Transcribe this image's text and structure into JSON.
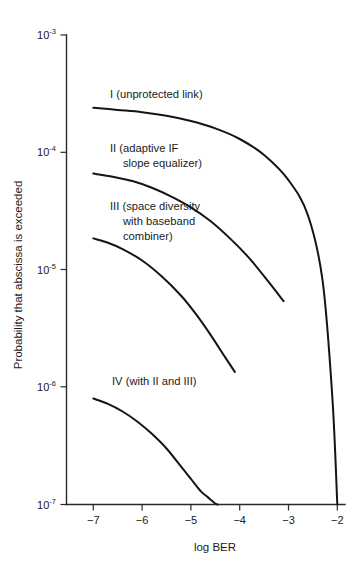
{
  "chart_data": {
    "type": "line",
    "title": "",
    "xlabel": "log BER",
    "ylabel": "Probability that abscissa is exceeded",
    "xlim": [
      -7.5,
      -1.8
    ],
    "ylim": [
      1e-07,
      0.001
    ],
    "yscale": "log",
    "xscale": "linear",
    "grid": false,
    "legend": "inline-annotations",
    "xticks": [
      -7,
      -6,
      -5,
      -4,
      -3,
      -2
    ],
    "xticklabels": [
      "−7",
      "−6",
      "−5",
      "−4",
      "−3",
      "−2"
    ],
    "yticks": [
      0.001,
      0.0001,
      1e-05,
      1e-06,
      1e-07
    ],
    "yticklabels": [
      "10−3",
      "10−4",
      "10−5",
      "10−6",
      "10−7"
    ],
    "ytick_mantissa": "10",
    "ytick_exponents": [
      "-3",
      "-4",
      "-5",
      "-6",
      "-7"
    ],
    "series": [
      {
        "name": "I (unprotected link)",
        "label_lines": [
          "I (unprotected link)"
        ],
        "x": [
          -7.0,
          -6.5,
          -6.0,
          -5.5,
          -5.0,
          -4.5,
          -4.0,
          -3.5,
          -3.0,
          -2.6,
          -2.3,
          -2.1,
          -2.0
        ],
        "y": [
          0.00024,
          0.00023,
          0.00022,
          0.000205,
          0.000185,
          0.00016,
          0.00013,
          9.5e-05,
          5.8e-05,
          2.9e-05,
          8e-06,
          8e-07,
          1e-07
        ]
      },
      {
        "name": "II (adaptive IF slope equalizer)",
        "label_lines": [
          "II (adaptive IF",
          "slope equalizer)"
        ],
        "x": [
          -7.0,
          -6.6,
          -6.2,
          -5.8,
          -5.4,
          -5.0,
          -4.6,
          -4.2,
          -3.8,
          -3.4,
          -3.1
        ],
        "y": [
          6.6e-05,
          6.2e-05,
          5.7e-05,
          5e-05,
          4.2e-05,
          3.4e-05,
          2.6e-05,
          1.85e-05,
          1.25e-05,
          7.8e-06,
          5.4e-06
        ]
      },
      {
        "name": "III (space diversity with baseband combiner)",
        "label_lines": [
          "III (space diversity",
          "with baseband",
          "combiner)"
        ],
        "x": [
          -7.0,
          -6.7,
          -6.4,
          -6.0,
          -5.6,
          -5.2,
          -4.9,
          -4.6,
          -4.3,
          -4.1
        ],
        "y": [
          1.85e-05,
          1.7e-05,
          1.5e-05,
          1.2e-05,
          8.8e-06,
          6e-06,
          4.2e-06,
          2.8e-06,
          1.8e-06,
          1.35e-06
        ]
      },
      {
        "name": "IV (with II and III)",
        "label_lines": [
          "IV (with II and III)"
        ],
        "x": [
          -7.0,
          -6.7,
          -6.4,
          -6.1,
          -5.8,
          -5.5,
          -5.2,
          -5.0,
          -4.8,
          -4.65,
          -4.5,
          -4.45
        ],
        "y": [
          8e-07,
          7.2e-07,
          6.2e-07,
          5.1e-07,
          4e-07,
          3e-07,
          2.1e-07,
          1.65e-07,
          1.3e-07,
          1.15e-07,
          1.02e-07,
          1e-07
        ]
      }
    ],
    "annotations": [
      {
        "text": "I (unprotected link)",
        "x": -6.9,
        "y": 0.0003
      },
      {
        "text": "II (adaptive IF",
        "x": -6.9,
        "y": 9.5e-05
      },
      {
        "text": "slope equalizer)",
        "x": -6.65,
        "y": 8e-05
      },
      {
        "text": "III (space diversity",
        "x": -6.9,
        "y": 2.7e-05
      },
      {
        "text": "with baseband",
        "x": -6.65,
        "y": 2.3e-05
      },
      {
        "text": "combiner)",
        "x": -6.65,
        "y": 2e-05
      },
      {
        "text": "IV (with II and III)",
        "x": -6.85,
        "y": 1.05e-06
      }
    ]
  },
  "axis": {
    "x_title": "log BER",
    "y_title": "Probability that abscissa is exceeded"
  },
  "curve_labels": {
    "one": "I (unprotected link)",
    "two_line1": "II (adaptive IF",
    "two_line2": "slope equalizer)",
    "three_line1": "III (space diversity",
    "three_line2": "with baseband",
    "three_line3": "combiner)",
    "four": "IV (with II and III)"
  },
  "xticklabels": {
    "t0": "−7",
    "t1": "−6",
    "t2": "−5",
    "t3": "−4",
    "t4": "−3",
    "t5": "−2"
  },
  "yticklabels": {
    "base": "10",
    "e0": "-3",
    "e1": "-4",
    "e2": "-5",
    "e3": "-6",
    "e4": "-7"
  },
  "colors": {
    "curve": "#141414",
    "axis": "#2b2b2b",
    "background": "#ffffff",
    "text": "#1a1a1a"
  }
}
